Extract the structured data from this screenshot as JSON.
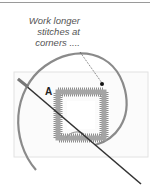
{
  "figure": {
    "caption_lines": [
      "Work longer",
      "stitches at",
      "corners ...."
    ],
    "label": "A",
    "colors": {
      "rule": "#9a9a9a",
      "hoop": "#8a8a8a",
      "stitch": "#7a7a7a",
      "needle": "#333333",
      "fabric_edge": "#dddddd"
    }
  }
}
